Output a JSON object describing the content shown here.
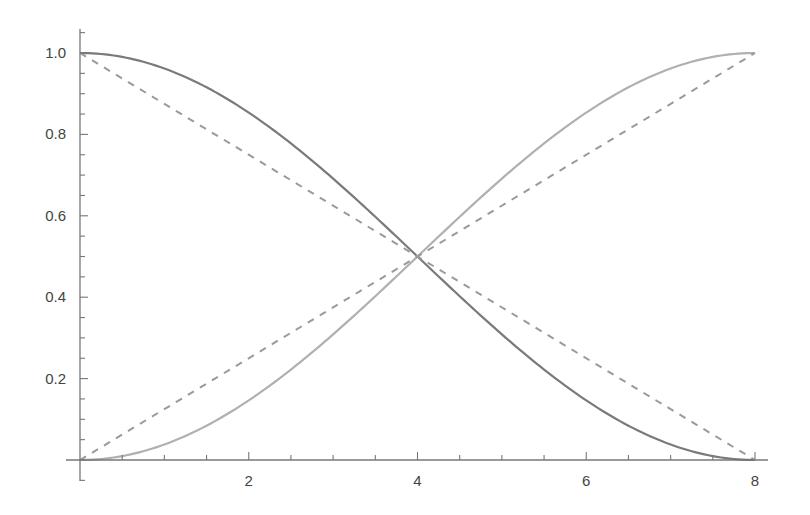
{
  "chart_data": {
    "type": "line",
    "title": "",
    "xlabel": "",
    "ylabel": "",
    "xlim": [
      0,
      8
    ],
    "ylim": [
      0,
      1.0
    ],
    "grid": false,
    "legend": null,
    "x_ticks": [
      {
        "value": 2,
        "label": "2"
      },
      {
        "value": 4,
        "label": "4"
      },
      {
        "value": 6,
        "label": "6"
      },
      {
        "value": 8,
        "label": "8"
      }
    ],
    "y_ticks": [
      {
        "value": 0.2,
        "label": "0.2"
      },
      {
        "value": 0.4,
        "label": "0.4"
      },
      {
        "value": 0.6,
        "label": "0.6"
      },
      {
        "value": 0.8,
        "label": "0.8"
      },
      {
        "value": 1.0,
        "label": "1.0"
      }
    ],
    "x_minor_step": 0.5,
    "y_minor_step": 0.05,
    "series": [
      {
        "name": "decreasing-curve",
        "style": "solid",
        "color": "#7a7a7a",
        "formula": "cos^2(pi*x/16)",
        "x": [
          0,
          1,
          2,
          3,
          4,
          5,
          6,
          7,
          8
        ],
        "values": [
          1.0,
          0.962,
          0.854,
          0.691,
          0.5,
          0.309,
          0.146,
          0.038,
          0.0
        ]
      },
      {
        "name": "increasing-curve",
        "style": "solid",
        "color": "#b0b0b0",
        "formula": "sin^2(pi*x/16)",
        "x": [
          0,
          1,
          2,
          3,
          4,
          5,
          6,
          7,
          8
        ],
        "values": [
          0.0,
          0.038,
          0.146,
          0.309,
          0.5,
          0.691,
          0.854,
          0.962,
          1.0
        ]
      },
      {
        "name": "decreasing-line",
        "style": "dashed",
        "color": "#9a9a9a",
        "formula": "1 - x/8",
        "x": [
          0,
          8
        ],
        "values": [
          1.0,
          0.0
        ]
      },
      {
        "name": "increasing-line",
        "style": "dashed",
        "color": "#9a9a9a",
        "formula": "x/8",
        "x": [
          0,
          8
        ],
        "values": [
          0.0,
          1.0
        ]
      }
    ]
  }
}
